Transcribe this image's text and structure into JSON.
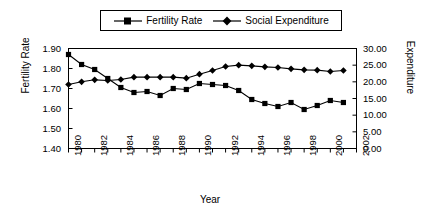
{
  "chart_data": {
    "type": "line",
    "title": "",
    "xlabel": "Year",
    "ylabel": "Fertility Rate",
    "y2label": "Expenditure",
    "grid": false,
    "legend_position": "top-center",
    "x": [
      1980,
      1981,
      1982,
      1983,
      1984,
      1985,
      1986,
      1987,
      1988,
      1989,
      1990,
      1991,
      1992,
      1993,
      1994,
      1995,
      1996,
      1997,
      1998,
      1999,
      2000,
      2001
    ],
    "xtick_labels": [
      "1980",
      "1982",
      "1984",
      "1986",
      "1988",
      "1990",
      "1992",
      "1994",
      "1996",
      "1998",
      "2000",
      "2002"
    ],
    "xtick_values": [
      1980,
      1982,
      1984,
      1986,
      1988,
      1990,
      1992,
      1994,
      1996,
      1998,
      2000,
      2002
    ],
    "xlim": [
      1980,
      2002
    ],
    "ylim": [
      1.4,
      1.9
    ],
    "ytick_labels": [
      "1.40",
      "1.50",
      "1.60",
      "1.70",
      "1.80",
      "1.90"
    ],
    "ytick_values": [
      1.4,
      1.5,
      1.6,
      1.7,
      1.8,
      1.9
    ],
    "y2lim": [
      0,
      30
    ],
    "y2tick_labels": [
      "0.00",
      "5.00",
      "10.00",
      "15.00",
      "20.00",
      "25.00",
      "30.00"
    ],
    "y2tick_values": [
      0,
      5,
      10,
      15,
      20,
      25,
      30
    ],
    "series": [
      {
        "name": "Fertility Rate",
        "axis": "left",
        "marker": "square",
        "color": "#000000",
        "values": [
          1.87,
          1.82,
          1.795,
          1.75,
          1.705,
          1.68,
          1.685,
          1.665,
          1.7,
          1.695,
          1.725,
          1.72,
          1.715,
          1.69,
          1.645,
          1.625,
          1.61,
          1.63,
          1.595,
          1.615,
          1.64,
          1.63
        ]
      },
      {
        "name": "Social Expenditure",
        "axis": "right",
        "marker": "diamond",
        "color": "#000000",
        "values": [
          19.2,
          20.0,
          20.6,
          20.4,
          20.7,
          21.4,
          21.4,
          21.4,
          21.4,
          21.1,
          22.3,
          23.4,
          24.6,
          25.0,
          24.8,
          24.5,
          24.3,
          23.9,
          23.6,
          23.5,
          23.1,
          23.4
        ]
      }
    ]
  },
  "legend": {
    "entries": [
      {
        "label": "Fertility Rate",
        "marker": "square-marker-icon"
      },
      {
        "label": "Social Expenditure",
        "marker": "diamond-marker-icon"
      }
    ]
  },
  "axes": {
    "x_title": "Year",
    "y_left_title": "Fertility Rate",
    "y_right_title": "Expenditure"
  }
}
